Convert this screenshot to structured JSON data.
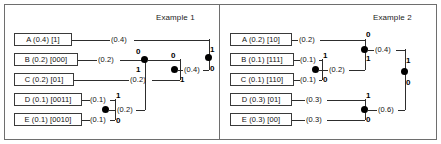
{
  "figure": {
    "kind": "huffman-coding-tree-diagram",
    "panels": [
      {
        "title": "Example 1",
        "symbols": [
          {
            "label": "A (0.4) [1]",
            "name": "A",
            "probability": 0.4,
            "code": "1"
          },
          {
            "label": "B (0.2) [000]",
            "name": "B",
            "probability": 0.2,
            "code": "000"
          },
          {
            "label": "C (0.2) [01]",
            "name": "C",
            "probability": 0.2,
            "code": "01"
          },
          {
            "label": "D (0.1) [0011]",
            "name": "D",
            "probability": 0.1,
            "code": "0011"
          },
          {
            "label": "E (0.1) [0010]",
            "name": "E",
            "probability": 0.1,
            "code": "0010"
          }
        ],
        "weights": [
          {
            "id": "w-a",
            "text": "(0.4)"
          },
          {
            "id": "w-b",
            "text": "(0.2)"
          },
          {
            "id": "w-c",
            "text": "(0.2)"
          },
          {
            "id": "w-d",
            "text": "(0.1)"
          },
          {
            "id": "w-e",
            "text": "(0.1)"
          },
          {
            "id": "w-de",
            "text": "(0.2)"
          },
          {
            "id": "w-m1",
            "text": "(0.4)"
          }
        ],
        "bits": [
          {
            "id": "b-de-top",
            "text": "1"
          },
          {
            "id": "b-de-bot",
            "text": "0"
          },
          {
            "id": "b-n1-top",
            "text": "0"
          },
          {
            "id": "b-n1-bot",
            "text": "1"
          },
          {
            "id": "b-n2-top",
            "text": "0"
          },
          {
            "id": "b-n2-bot",
            "text": "1"
          },
          {
            "id": "b-root-top",
            "text": "1"
          },
          {
            "id": "b-root-bot",
            "text": "0"
          }
        ]
      },
      {
        "title": "Example 2",
        "symbols": [
          {
            "label": "A (0.2) [10]",
            "name": "A",
            "probability": 0.2,
            "code": "10"
          },
          {
            "label": "B (0.1) [111]",
            "name": "B",
            "probability": 0.1,
            "code": "111"
          },
          {
            "label": "C (0.1) [110]",
            "name": "C",
            "probability": 0.1,
            "code": "110"
          },
          {
            "label": "D (0.3) [01]",
            "name": "D",
            "probability": 0.3,
            "code": "01"
          },
          {
            "label": "E (0.3) [00]",
            "name": "E",
            "probability": 0.3,
            "code": "00"
          }
        ],
        "weights": [
          {
            "id": "w-a",
            "text": "(0.2)"
          },
          {
            "id": "w-b",
            "text": "(0.1)"
          },
          {
            "id": "w-c",
            "text": "(0.1)"
          },
          {
            "id": "w-d",
            "text": "(0.3)"
          },
          {
            "id": "w-e",
            "text": "(0.3)"
          },
          {
            "id": "w-bc",
            "text": "(0.2)"
          },
          {
            "id": "w-m1",
            "text": "(0.4)"
          },
          {
            "id": "w-m2",
            "text": "(0.6)"
          }
        ],
        "bits": [
          {
            "id": "b-bc-top",
            "text": "1"
          },
          {
            "id": "b-bc-bot",
            "text": "0"
          },
          {
            "id": "b-n1-top",
            "text": "0"
          },
          {
            "id": "b-n1-bot",
            "text": "1"
          },
          {
            "id": "b-n2-top",
            "text": "1"
          },
          {
            "id": "b-n2-bot",
            "text": "0"
          },
          {
            "id": "b-root-top",
            "text": "1"
          },
          {
            "id": "b-root-bot",
            "text": "0"
          }
        ]
      }
    ]
  }
}
